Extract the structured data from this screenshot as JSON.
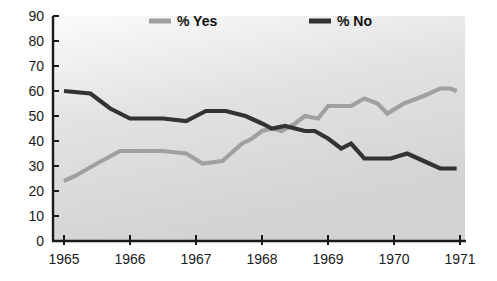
{
  "chart_data": {
    "type": "line",
    "title": "",
    "subtitle": "",
    "xlabel": "",
    "ylabel": "",
    "xlim": [
      1965,
      1971
    ],
    "ylim": [
      0,
      90
    ],
    "y_ticks": [
      0,
      10,
      20,
      30,
      40,
      50,
      60,
      70,
      80,
      90
    ],
    "x_ticks": [
      1965,
      1966,
      1967,
      1968,
      1969,
      1970,
      1971
    ],
    "x_tick_labels": [
      "1965",
      "1966",
      "1967",
      "1968",
      "1969",
      "1970",
      "1971"
    ],
    "y_tick_labels": [
      "0",
      "10",
      "20",
      "30",
      "40",
      "50",
      "60",
      "70",
      "80",
      "90"
    ],
    "grid": false,
    "legend_position": "top",
    "plot_background": "#d6d6d6",
    "figure_background": "#ffffff",
    "axis_color": "#1a1a1a",
    "series": [
      {
        "name": "% Yes",
        "color": "#a0a0a0",
        "legend_label": "% Yes",
        "points": [
          {
            "x": 1965.0,
            "y": 24
          },
          {
            "x": 1965.17,
            "y": 26
          },
          {
            "x": 1965.5,
            "y": 31
          },
          {
            "x": 1965.85,
            "y": 36
          },
          {
            "x": 1966.0,
            "y": 36
          },
          {
            "x": 1966.5,
            "y": 36
          },
          {
            "x": 1966.85,
            "y": 35
          },
          {
            "x": 1967.1,
            "y": 31
          },
          {
            "x": 1967.4,
            "y": 32
          },
          {
            "x": 1967.7,
            "y": 39
          },
          {
            "x": 1967.85,
            "y": 41
          },
          {
            "x": 1968.0,
            "y": 44
          },
          {
            "x": 1968.15,
            "y": 45
          },
          {
            "x": 1968.3,
            "y": 44
          },
          {
            "x": 1968.5,
            "y": 47
          },
          {
            "x": 1968.65,
            "y": 50
          },
          {
            "x": 1968.85,
            "y": 49
          },
          {
            "x": 1969.0,
            "y": 54
          },
          {
            "x": 1969.35,
            "y": 54
          },
          {
            "x": 1969.55,
            "y": 57
          },
          {
            "x": 1969.75,
            "y": 55
          },
          {
            "x": 1969.9,
            "y": 51
          },
          {
            "x": 1970.15,
            "y": 55
          },
          {
            "x": 1970.45,
            "y": 58
          },
          {
            "x": 1970.7,
            "y": 61
          },
          {
            "x": 1970.85,
            "y": 61
          },
          {
            "x": 1970.95,
            "y": 60
          }
        ]
      },
      {
        "name": "% No",
        "color": "#333333",
        "legend_label": "% No",
        "points": [
          {
            "x": 1965.0,
            "y": 60
          },
          {
            "x": 1965.4,
            "y": 59
          },
          {
            "x": 1965.7,
            "y": 53
          },
          {
            "x": 1966.0,
            "y": 49
          },
          {
            "x": 1966.5,
            "y": 49
          },
          {
            "x": 1966.85,
            "y": 48
          },
          {
            "x": 1967.15,
            "y": 52
          },
          {
            "x": 1967.45,
            "y": 52
          },
          {
            "x": 1967.75,
            "y": 50
          },
          {
            "x": 1968.0,
            "y": 47
          },
          {
            "x": 1968.15,
            "y": 45
          },
          {
            "x": 1968.35,
            "y": 46
          },
          {
            "x": 1968.5,
            "y": 45
          },
          {
            "x": 1968.65,
            "y": 44
          },
          {
            "x": 1968.8,
            "y": 44
          },
          {
            "x": 1969.0,
            "y": 41
          },
          {
            "x": 1969.2,
            "y": 37
          },
          {
            "x": 1969.35,
            "y": 39
          },
          {
            "x": 1969.55,
            "y": 33
          },
          {
            "x": 1969.95,
            "y": 33
          },
          {
            "x": 1970.2,
            "y": 35
          },
          {
            "x": 1970.45,
            "y": 32
          },
          {
            "x": 1970.7,
            "y": 29
          },
          {
            "x": 1970.95,
            "y": 29
          }
        ]
      }
    ]
  },
  "legend": {
    "items": [
      {
        "label": "% Yes",
        "color": "#a0a0a0"
      },
      {
        "label": "% No",
        "color": "#333333"
      }
    ]
  }
}
